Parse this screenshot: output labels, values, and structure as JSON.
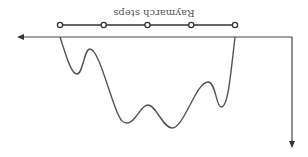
{
  "diagram": {
    "title": "Raymarch steps",
    "orientation": "rotated 180 degrees",
    "steps": {
      "count": 5,
      "label": "Raymarch steps"
    },
    "axes": {
      "horizontal": "distance axis (arrow)",
      "vertical": "depth axis (arrow)"
    },
    "surface": {
      "description": "wavy terrain curve with three valleys and two inner peaks"
    },
    "colors": {
      "line": "#333333",
      "curve": "#555555",
      "background": "#ffffff"
    }
  }
}
